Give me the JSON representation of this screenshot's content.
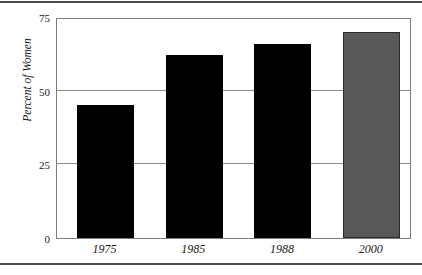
{
  "chart_data": {
    "type": "bar",
    "title": "",
    "subtitle": "",
    "xlabel": "",
    "ylabel": "Percent of Women",
    "categories": [
      "1975",
      "1985",
      "1988",
      "2000"
    ],
    "values": [
      45,
      62,
      66,
      70
    ],
    "series": [
      {
        "name": "Percent of Women",
        "values": [
          45,
          62,
          66,
          70
        ]
      }
    ],
    "ylim": [
      0,
      75
    ],
    "yticks": [
      0,
      25,
      50,
      75
    ],
    "ytick_labels": [
      "0",
      "25",
      "50",
      "75"
    ],
    "xtick_labels": [
      "1975",
      "1985",
      "1988",
      "2000"
    ],
    "grid": "horizontal",
    "legend": "none",
    "bar_colors": [
      "#000000",
      "#000000",
      "#000000",
      "#585858"
    ],
    "colors": {
      "bar_dark": "#000000",
      "bar_gray": "#585858",
      "bar_gray_border": "#2b2b2b",
      "axis": "#7d7d7d",
      "gridline": "#8a8a8a",
      "rule": "#4a4a4a",
      "text": "#1a1a1a",
      "background": "#ffffff"
    },
    "annotations": []
  }
}
